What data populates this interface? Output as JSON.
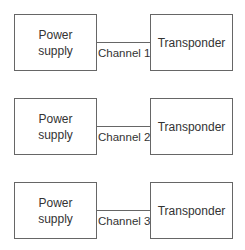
{
  "diagram": {
    "rows": [
      {
        "source": "Power supply",
        "target": "Transponder",
        "channel": "Channel 1"
      },
      {
        "source": "Power supply",
        "target": "Transponder",
        "channel": "Channel 2"
      },
      {
        "source": "Power supply",
        "target": "Transponder",
        "channel": "Channel 3"
      }
    ],
    "colors": {
      "stroke": "#666666",
      "text": "#333333",
      "background": "#ffffff"
    }
  }
}
